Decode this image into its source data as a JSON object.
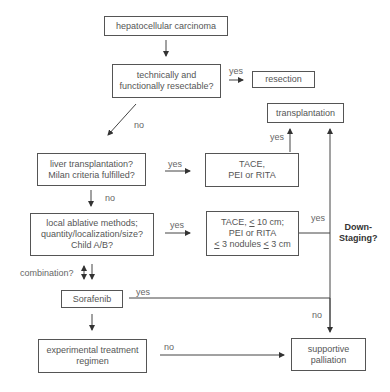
{
  "nodes": {
    "hcc": {
      "lines": [
        "hepatocellular carcinoma"
      ]
    },
    "resectable": {
      "lines": [
        "technically and",
        "functionally resectable?"
      ]
    },
    "resection": {
      "lines": [
        "resection"
      ]
    },
    "transplantation": {
      "lines": [
        "transplantation"
      ]
    },
    "liver_tx": {
      "lines": [
        "liver transplantation?",
        "Milan criteria fulfilled?"
      ]
    },
    "tace1": {
      "lines": [
        "TACE,",
        "PEI or RITA"
      ]
    },
    "local_ablative": {
      "lines": [
        "local ablative methods;",
        "quantity/localization/size?",
        "Child A/B?"
      ]
    },
    "tace2": {
      "line1_pre": "TACE, ",
      "line1_sym": "<",
      "line1_post": " 10 cm;",
      "line2": "PEI or RITA",
      "line3_sym1": "<",
      "line3_mid": " 3 nodules ",
      "line3_sym2": "<",
      "line3_post": " 3 cm"
    },
    "sorafenib": {
      "lines": [
        "Sorafenib"
      ]
    },
    "experimental": {
      "lines": [
        "experimental treatment",
        "regimen"
      ]
    },
    "supportive": {
      "lines": [
        "supportive",
        "palliation"
      ]
    }
  },
  "labels": {
    "yes_resect": "yes",
    "no_resect": "no",
    "yes_tx": "yes",
    "yes_liver": "yes",
    "no_liver": "no",
    "yes_local": "yes",
    "yes_tace2": "yes",
    "combination": "combination?",
    "yes_sorafenib": "yes",
    "no_right": "no",
    "no_experimental": "no",
    "downstaging_1": "Down-",
    "downstaging_2": "Staging?"
  }
}
